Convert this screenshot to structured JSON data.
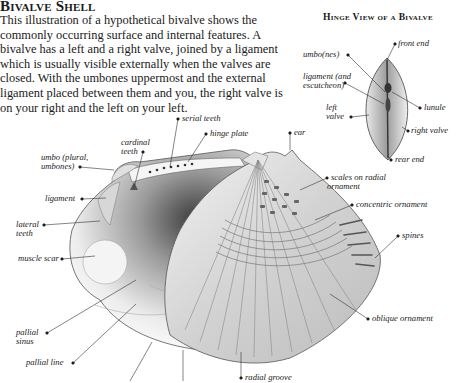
{
  "header": {
    "title": "Bivalve Shell",
    "intro": "This illustration of a hypothetical bivalve shows the commonly occurring surface and internal features. A bivalve has a left and a right valve, joined by a ligament which is usually visible externally when the valves are closed. With the umbones uppermost and the external ligament placed between them and you, the right valve is on your right and the left on your left."
  },
  "inset": {
    "title": "Hinge View of a Bivalve",
    "labels": {
      "front_end": "front end",
      "umbo": "umbo(nes)",
      "ligament_1": "ligament (and",
      "ligament_2": "escutcheon)",
      "left_valve_1": "left",
      "left_valve_2": "valve",
      "lunule": "lunule",
      "right_valve": "right valve",
      "rear_end": "rear end"
    }
  },
  "main": {
    "labels": {
      "serial_teeth": "serial teeth",
      "hinge_plate": "hinge plate",
      "ear": "ear",
      "cardinal_teeth_1": "cardinal",
      "cardinal_teeth_2": "teeth",
      "umbo_1": "umbo (plural,",
      "umbo_2": "umbones)",
      "ligament": "ligament",
      "lateral_teeth_1": "lateral",
      "lateral_teeth_2": "teeth",
      "muscle_scar": "muscle scar",
      "pallial_sinus_1": "pallial",
      "pallial_sinus_2": "sinus",
      "pallial_line": "pallial line",
      "scales_1": "scales on radial",
      "scales_2": "ornament",
      "concentric": "concentric ornament",
      "spines": "spines",
      "oblique": "oblique ornament",
      "radial_groove": "radial groove"
    }
  }
}
